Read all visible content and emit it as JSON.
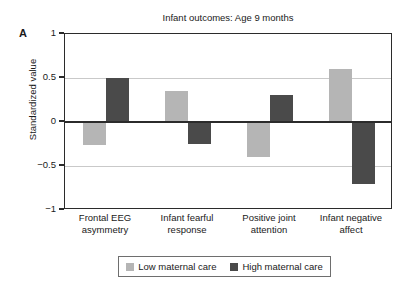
{
  "panel": {
    "letter": "A"
  },
  "chart_data": {
    "type": "bar",
    "title": "Infant outcomes: Age 9 months",
    "xlabel": "",
    "ylabel": "Standardized value",
    "ylim": [
      -1,
      1
    ],
    "yticks": [
      1,
      0.5,
      0,
      -0.5,
      -1
    ],
    "ytick_labels": [
      "1",
      "0.5",
      "0",
      "−0.5",
      "−1"
    ],
    "grid": "horizontal",
    "legend_position": "bottom",
    "zero_line": 0,
    "categories": [
      "Frontal EEG asymmetry",
      "Infant fearful response",
      "Positive joint attention",
      "Infant negative affect"
    ],
    "category_lines": [
      [
        "Frontal EEG",
        "asymmetry"
      ],
      [
        "Infant fearful",
        "response"
      ],
      [
        "Positive joint",
        "attention"
      ],
      [
        "Infant negative",
        "affect"
      ]
    ],
    "series": [
      {
        "name": "Low maternal care",
        "color": "#b5b5b5",
        "values": [
          -0.26,
          0.35,
          -0.4,
          0.6
        ]
      },
      {
        "name": "High maternal care",
        "color": "#4a4a4a",
        "values": [
          0.5,
          -0.25,
          0.31,
          -0.7
        ]
      }
    ]
  },
  "legend": {
    "entries": [
      {
        "label": "Low maternal care",
        "color": "#b5b5b5"
      },
      {
        "label": "High maternal care",
        "color": "#4a4a4a"
      }
    ]
  },
  "colors": {
    "low_maternal_care": "#b5b5b5",
    "high_maternal_care": "#4a4a4a",
    "axis": "#2b2b2b",
    "gridline": "#c9c9c9",
    "background": "#ffffff"
  }
}
